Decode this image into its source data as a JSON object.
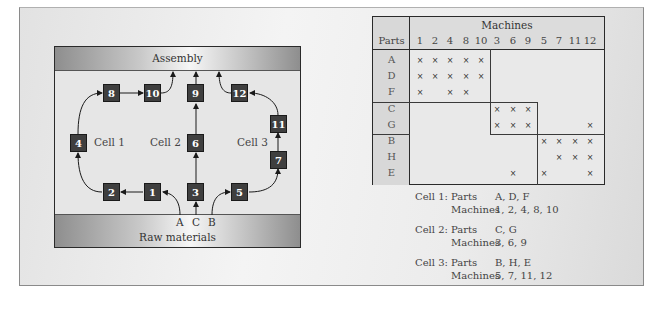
{
  "flow_diagram": {
    "top_bar_label": "Assembly",
    "bottom_bar_label": "Raw materials",
    "feeds": [
      "A",
      "C",
      "B"
    ],
    "cells": [
      {
        "label": "Cell 1"
      },
      {
        "label": "Cell 2"
      },
      {
        "label": "Cell 3"
      }
    ],
    "machines": {
      "m1": "1",
      "m2": "2",
      "m3": "3",
      "m4": "4",
      "m5": "5",
      "m6": "6",
      "m7": "7",
      "m8": "8",
      "m9": "9",
      "m10": "10",
      "m11": "11",
      "m12": "12"
    },
    "colors": {
      "machine_box": "#3f3f3f",
      "machine_text": "#ffffff",
      "bar_dark": "#8e8e8e",
      "bar_light": "#f6f6f6"
    }
  },
  "matrix": {
    "title": "Machines",
    "parts_header": "Parts",
    "machine_columns": [
      "1",
      "2",
      "4",
      "8",
      "10",
      "3",
      "6",
      "9",
      "5",
      "7",
      "11",
      "12"
    ],
    "parts_rows": [
      "A",
      "D",
      "F",
      "C",
      "G",
      "B",
      "H",
      "E"
    ],
    "mark": "×",
    "rows": [
      {
        "part": "A",
        "marks": [
          "1",
          "2",
          "4",
          "8",
          "10"
        ]
      },
      {
        "part": "D",
        "marks": [
          "1",
          "2",
          "4",
          "8",
          "10"
        ]
      },
      {
        "part": "F",
        "marks": [
          "1",
          "4",
          "8"
        ]
      },
      {
        "part": "C",
        "marks": [
          "3",
          "6",
          "9"
        ]
      },
      {
        "part": "G",
        "marks": [
          "3",
          "6",
          "9",
          "12"
        ]
      },
      {
        "part": "B",
        "marks": [
          "5",
          "7",
          "11",
          "12"
        ]
      },
      {
        "part": "H",
        "marks": [
          "7",
          "11",
          "12"
        ]
      },
      {
        "part": "E",
        "marks": [
          "6",
          "5",
          "12"
        ]
      }
    ]
  },
  "legend": [
    {
      "cell": "Cell 1:",
      "parts_label": "Parts",
      "parts": "A, D, F",
      "machines_label": "Machines",
      "machines": "1, 2, 4, 8, 10"
    },
    {
      "cell": "Cell 2:",
      "parts_label": "Parts",
      "parts": "C, G",
      "machines_label": "Machines",
      "machines": "3, 6, 9"
    },
    {
      "cell": "Cell 3:",
      "parts_label": "Parts",
      "parts": "B, H, E",
      "machines_label": "Machines",
      "machines": "5, 7, 11, 12"
    }
  ]
}
